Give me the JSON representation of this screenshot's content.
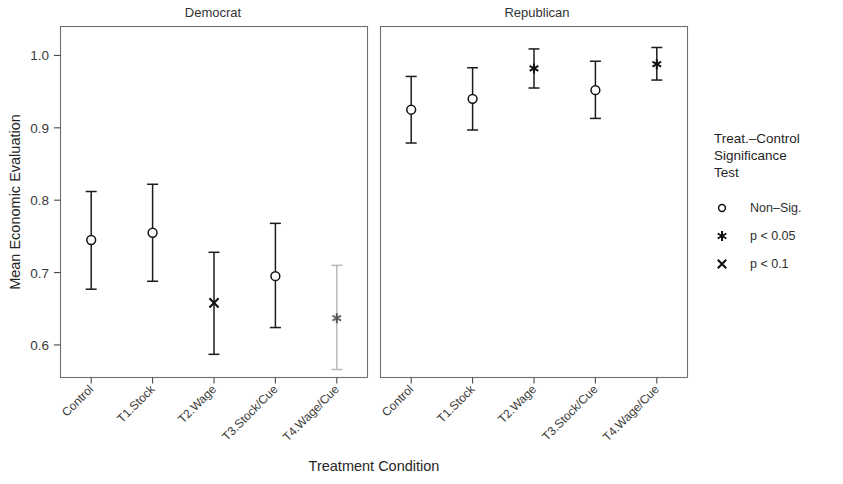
{
  "figure": {
    "xlabel": "Treatment Condition",
    "ylabel": "Mean Economic Evaluation"
  },
  "legend": {
    "title_line1": "Treat.–Control",
    "title_line2": "Significance",
    "title_line3": "Test",
    "items": [
      {
        "marker": "circle-icon",
        "label": "Non–Sig."
      },
      {
        "marker": "asterisk-icon",
        "label": "p < 0.05"
      },
      {
        "marker": "cross-icon",
        "label": "p < 0.1"
      }
    ]
  },
  "chart_data": {
    "type": "scatter",
    "title": "",
    "xlabel": "Treatment Condition",
    "ylabel": "Mean Economic Evaluation",
    "ylim": [
      0.555,
      1.04
    ],
    "yticks": [
      0.6,
      0.7,
      0.8,
      0.9,
      1.0
    ],
    "ytick_labels": [
      "0.6",
      "0.7",
      "0.8",
      "0.9",
      "1.0"
    ],
    "grid": false,
    "legend_position": "right",
    "categories": [
      "Control",
      "T1.Stock",
      "T2.Wage",
      "T3.Stock/Cue",
      "T4.Wage/Cue"
    ],
    "panels": [
      {
        "name": "Democrat",
        "points": [
          {
            "category": "Control",
            "value": 0.745,
            "low": 0.677,
            "high": 0.812,
            "significance": "Non–Sig.",
            "marker": "circle-icon"
          },
          {
            "category": "T1.Stock",
            "value": 0.755,
            "low": 0.688,
            "high": 0.822,
            "significance": "Non–Sig.",
            "marker": "circle-icon"
          },
          {
            "category": "T2.Wage",
            "value": 0.658,
            "low": 0.587,
            "high": 0.728,
            "significance": "p < 0.1",
            "marker": "cross-icon"
          },
          {
            "category": "T3.Stock/Cue",
            "value": 0.695,
            "low": 0.624,
            "high": 0.768,
            "significance": "Non–Sig.",
            "marker": "circle-icon"
          },
          {
            "category": "T4.Wage/Cue",
            "value": 0.637,
            "low": 0.566,
            "high": 0.71,
            "significance": "p < 0.05",
            "marker": "asterisk-icon"
          }
        ]
      },
      {
        "name": "Republican",
        "points": [
          {
            "category": "Control",
            "value": 0.925,
            "low": 0.879,
            "high": 0.971,
            "significance": "Non–Sig.",
            "marker": "circle-icon"
          },
          {
            "category": "T1.Stock",
            "value": 0.94,
            "low": 0.897,
            "high": 0.983,
            "significance": "Non–Sig.",
            "marker": "circle-icon"
          },
          {
            "category": "T2.Wage",
            "value": 0.982,
            "low": 0.955,
            "high": 1.009,
            "significance": "p < 0.05",
            "marker": "asterisk-icon"
          },
          {
            "category": "T3.Stock/Cue",
            "value": 0.952,
            "low": 0.913,
            "high": 0.992,
            "significance": "Non–Sig.",
            "marker": "circle-icon"
          },
          {
            "category": "T4.Wage/Cue",
            "value": 0.988,
            "low": 0.966,
            "high": 1.011,
            "significance": "p < 0.05",
            "marker": "asterisk-icon"
          }
        ]
      }
    ]
  }
}
